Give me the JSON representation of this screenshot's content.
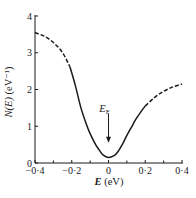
{
  "chart_data": {
    "type": "line",
    "title": "",
    "xlabel": "E (eV)",
    "ylabel": "N(E) (eV⁻¹)",
    "xlim": [
      -0.4,
      0.4
    ],
    "ylim": [
      0,
      4
    ],
    "x_ticks": [
      -0.4,
      -0.2,
      0,
      0.2,
      0.4
    ],
    "x_tick_labels": [
      "−0·4",
      "−0·2",
      "0",
      "0·2",
      "0·4"
    ],
    "x_minor_ticks": [
      -0.3,
      -0.1,
      0.1,
      0.3
    ],
    "y_ticks": [
      0,
      1,
      2,
      3,
      4
    ],
    "y_tick_labels": [
      "0",
      "1",
      "2",
      "3",
      "4"
    ],
    "grid": false,
    "legend": null,
    "series": [
      {
        "name": "N(E) extrapolated (dashed, low E)",
        "style": "dashed",
        "x": [
          -0.4,
          -0.35,
          -0.3,
          -0.25,
          -0.21
        ],
        "y": [
          3.55,
          3.45,
          3.28,
          3.0,
          2.62
        ]
      },
      {
        "name": "N(E) measured (solid)",
        "style": "solid",
        "x": [
          -0.21,
          -0.18,
          -0.15,
          -0.12,
          -0.1,
          -0.07,
          -0.05,
          -0.03,
          0,
          0.03,
          0.05,
          0.08,
          0.1,
          0.13,
          0.15,
          0.18,
          0.2
        ],
        "y": [
          2.62,
          2.1,
          1.5,
          1.05,
          0.8,
          0.5,
          0.35,
          0.22,
          0.15,
          0.2,
          0.3,
          0.55,
          0.75,
          1.02,
          1.2,
          1.42,
          1.55
        ]
      },
      {
        "name": "N(E) extrapolated (dashed, high E)",
        "style": "dashed",
        "x": [
          0.2,
          0.25,
          0.3,
          0.35,
          0.4
        ],
        "y": [
          1.55,
          1.78,
          1.95,
          2.07,
          2.15
        ]
      }
    ],
    "annotations": [
      {
        "text": "E_F",
        "display": "E",
        "subscript": "F",
        "x": 0,
        "y_text": 1.5,
        "arrow_from": 1.35,
        "arrow_to": 0.55
      }
    ]
  },
  "caption": "…"
}
